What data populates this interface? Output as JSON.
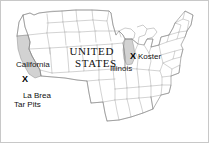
{
  "figure": {
    "kind": "map",
    "region": "United States",
    "background_color": "#ffffff",
    "border_color": "#c8c8c8",
    "state_outline_color": "#9a9a9a",
    "coastline_color": "#8a8a8a",
    "highlight_fill_color": "#d2d2d2",
    "text_color": "#111111"
  },
  "title": {
    "line1": "UNITED",
    "line2": "STATES"
  },
  "highlighted_states": [
    {
      "name": "California",
      "fill": "#d2d2d2"
    },
    {
      "name": "Illinois",
      "fill": "#d2d2d2"
    }
  ],
  "state_labels": [
    {
      "text": "California"
    },
    {
      "text": "Illinois"
    }
  ],
  "sites": [
    {
      "marker": "X",
      "label_line1": "La Brea",
      "label_line2": "Tar Pits"
    },
    {
      "marker": "X",
      "label_line1": "Koster",
      "label_line2": ""
    }
  ]
}
